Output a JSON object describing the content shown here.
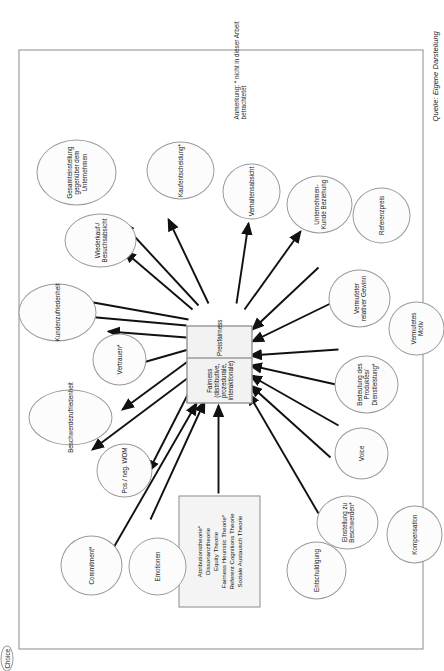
{
  "figure": {
    "note": "Anmerkung: * nicht in dieser Arbeit betrachtetet",
    "source": "Quelle: Eigene Darstellung"
  },
  "theory_box": {
    "lines": [
      "Attributionstheorie*",
      "Dissonanztheorie",
      "Equity Theorie",
      "Fairness Heuristic Theorie*",
      "Referent Cognitions Theorie",
      "Soziale Austausch Theorie"
    ],
    "text": "Attributionstheorie*\nDissonanztheorie\nEquity Theorie\nFairness Heuristic Theorie*\nReferent Cognitions Theorie\nSoziale Austausch Theorie"
  },
  "center": {
    "cell_one": "Fairness (distributive, prozedurale, interaktionale)",
    "cell_two": "Preisfairness"
  },
  "antecedents": [
    {
      "label": "Entschuldigung"
    },
    {
      "label": "Einstellung zu Beschwerden*"
    },
    {
      "label": "Kompensation"
    },
    {
      "label": "Voice"
    },
    {
      "label": "Choice"
    },
    {
      "label": "Bedeutung des Produktes/ Dienstleistung*"
    },
    {
      "label": "Vermutetes Motiv"
    },
    {
      "label": "Vermuteter relativer Gewinn"
    },
    {
      "label": "Referenzpreis"
    }
  ],
  "consequences": [
    {
      "label": "Commitment*"
    },
    {
      "label": "Emotionen"
    },
    {
      "label": "Pos./ neg. WOM"
    },
    {
      "label": "Beschwerdezufriedenheit"
    },
    {
      "label": "Vertrauen*"
    },
    {
      "label": "Kundenzufriedenheit"
    },
    {
      "label": "Wiederkauf-/ Besuchsabsicht"
    },
    {
      "label": "Gesamteinstellung gegenüber dem Unternehmen"
    },
    {
      "label": "Kaufentscheidung*"
    },
    {
      "label": "Verhaltensabsicht"
    },
    {
      "label": "Unternehmen-Kunde Beziehung"
    }
  ],
  "colors": {
    "frame_border": "#8b8b8b",
    "node_border": "#9a9a9a",
    "node_fill": "#fcfcfc",
    "box_fill": "#f2f2f2",
    "arrow": "#111111"
  }
}
